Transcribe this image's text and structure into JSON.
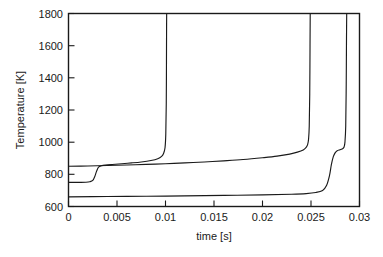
{
  "chart_data": {
    "type": "line",
    "title": "",
    "xlabel": "time [s]",
    "ylabel": "Temperature [K]",
    "xlim": [
      0,
      0.03
    ],
    "ylim": [
      600,
      1800
    ],
    "xticks": [
      0,
      0.005,
      0.01,
      0.015,
      0.02,
      0.025,
      0.03
    ],
    "xtick_labels": [
      "0",
      "0.005",
      "0.01",
      "0.015",
      "0.02",
      "0.025",
      "0.03"
    ],
    "yticks": [
      600,
      800,
      1000,
      1200,
      1400,
      1600,
      1800
    ],
    "ytick_labels": [
      "600",
      "800",
      "1000",
      "1200",
      "1400",
      "1600",
      "1800"
    ],
    "grid": false,
    "legend": "none",
    "frame": "box",
    "line_color": "#1a1a1a",
    "background_color": "#ffffff",
    "series": [
      {
        "name": "curve-1",
        "description": "Ignites earliest; steps from 750 K to ~855 K near t=0.003 s then thermal runaway at t=0.0101 s",
        "ignition_time": 0.0101,
        "x": [
          0.0,
          0.001,
          0.0018,
          0.0022,
          0.0025,
          0.0027,
          0.0029,
          0.0031,
          0.0034,
          0.0038,
          0.0045,
          0.0055,
          0.0065,
          0.0075,
          0.0085,
          0.0092,
          0.0096,
          0.0098,
          0.00995,
          0.01003,
          0.01008,
          0.0101,
          0.01011,
          0.01012
        ],
        "y": [
          750,
          750,
          751,
          754,
          762,
          785,
          820,
          845,
          853,
          857,
          861,
          866,
          871,
          877,
          886,
          897,
          912,
          930,
          965,
          1050,
          1250,
          1500,
          1700,
          1800
        ]
      },
      {
        "name": "curve-2",
        "description": "Starts at 850 K, slow rise across the window, thermal runaway at t=0.0248 s",
        "ignition_time": 0.0248,
        "x": [
          0.0,
          0.002,
          0.004,
          0.006,
          0.008,
          0.01,
          0.012,
          0.014,
          0.016,
          0.018,
          0.02,
          0.0215,
          0.0228,
          0.0236,
          0.0242,
          0.0245,
          0.02465,
          0.02475,
          0.02482,
          0.02487,
          0.0249,
          0.02492
        ],
        "y": [
          850,
          852,
          855,
          858,
          862,
          866,
          871,
          877,
          884,
          892,
          903,
          913,
          926,
          938,
          952,
          968,
          985,
          1020,
          1100,
          1300,
          1600,
          1800
        ]
      },
      {
        "name": "curve-3",
        "description": "Coolest start at 660 K, long induction, shoulder near 950 K, thermal runaway at t=0.0286 s",
        "ignition_time": 0.0286,
        "x": [
          0.0,
          0.004,
          0.008,
          0.012,
          0.016,
          0.02,
          0.023,
          0.0245,
          0.0255,
          0.0262,
          0.0266,
          0.0269,
          0.0271,
          0.0273,
          0.0275,
          0.0277,
          0.028,
          0.0282,
          0.0284,
          0.0285,
          0.02858,
          0.02863,
          0.02866,
          0.02868
        ],
        "y": [
          660,
          662,
          664,
          666,
          669,
          672,
          676,
          680,
          687,
          700,
          730,
          790,
          860,
          910,
          935,
          947,
          953,
          958,
          968,
          1000,
          1100,
          1350,
          1650,
          1800
        ]
      }
    ]
  }
}
